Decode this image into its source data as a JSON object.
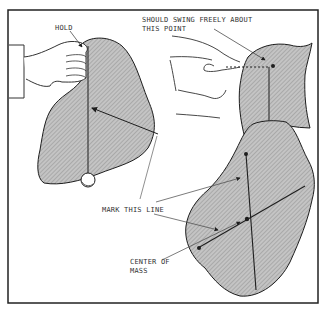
{
  "diagram": {
    "labels": {
      "hold": "HOLD",
      "swing_line1": "SHOULD SWING FREELY ABOUT",
      "swing_line2": "THIS POINT",
      "mark_line": "MARK THIS LINE",
      "center_line1": "CENTER OF",
      "center_line2": "MASS"
    },
    "colors": {
      "border": "#222222",
      "shape_fill": "#bdbdbd",
      "hatch": "#8f8f8f",
      "outline": "#1e1e1e",
      "label": "#333333"
    }
  }
}
